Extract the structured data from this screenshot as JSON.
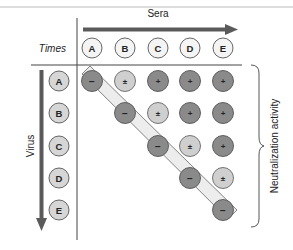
{
  "diagram": {
    "title_axis_columns": "Sera",
    "title_axis_rows": "Virus",
    "corner_label": "Times",
    "side_label": "Neutralization activity",
    "columns": [
      "A",
      "B",
      "C",
      "D",
      "E"
    ],
    "rows": [
      "A",
      "B",
      "C",
      "D",
      "E"
    ],
    "grid": [
      [
        "−",
        "±",
        "+",
        "+",
        "+"
      ],
      [
        "",
        "−",
        "±",
        "+",
        "+"
      ],
      [
        "",
        "",
        "−",
        "±",
        "+"
      ],
      [
        "",
        "",
        "",
        "−",
        "±"
      ],
      [
        "",
        "",
        "",
        "",
        "−"
      ]
    ],
    "legend": {
      "minus": "−",
      "plusminus": "±",
      "plus": "+"
    },
    "colors": {
      "dark_circle": "#8a8a8a",
      "light_circle": "#cfcfcf",
      "header_circle": "#f2f2f2",
      "row_circle": "#d6d6d6",
      "arrow": "#5a5a5a",
      "line": "#333333",
      "band_fill": "#ededed",
      "band_stroke": "#777777"
    }
  }
}
